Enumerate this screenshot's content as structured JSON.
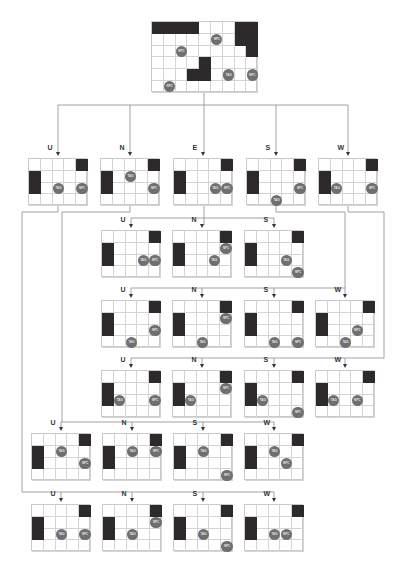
{
  "colors": {
    "line": "#8a8a8a",
    "wall": "#2e2a2b",
    "agent": "#6f6f6f",
    "grid": "#d4d4d4"
  },
  "legend": {
    "tag_label": "TAG",
    "npc_label": "NPC"
  },
  "root": {
    "x": 151,
    "y": 21,
    "cols": 9,
    "rows": 6,
    "cell": 11.8,
    "walls": [
      [
        0,
        0,
        4,
        1
      ],
      [
        7,
        0,
        2,
        2
      ],
      [
        8,
        2,
        1,
        1
      ],
      [
        4,
        3,
        1,
        2
      ],
      [
        3,
        4,
        1,
        1
      ]
    ],
    "agents": [
      {
        "t": "NPC",
        "c": 5.5,
        "r": 1.5
      },
      {
        "t": "NPC",
        "c": 2.5,
        "r": 2.5
      },
      {
        "t": "TAG",
        "c": 6.5,
        "r": 4.5
      },
      {
        "t": "NPC",
        "c": 8.5,
        "r": 4.5
      },
      {
        "t": "NPC",
        "c": 1.5,
        "r": 5.5
      }
    ]
  },
  "nodes": [
    {
      "id": "r1-U",
      "label": "U",
      "x": 28,
      "y": 158,
      "tag": [
        2.5,
        2.5
      ],
      "npc": [
        4.5,
        2.5
      ]
    },
    {
      "id": "r1-N",
      "label": "N",
      "x": 100,
      "y": 158,
      "tag": [
        2.5,
        1.5
      ],
      "npc": [
        4.5,
        2.5
      ]
    },
    {
      "id": "r1-E",
      "label": "E",
      "x": 173,
      "y": 158,
      "tag": [
        3.5,
        2.5
      ],
      "npc": [
        4.5,
        2.5
      ]
    },
    {
      "id": "r1-S",
      "label": "S",
      "x": 246,
      "y": 158,
      "tag": [
        2.5,
        3.5
      ],
      "npc": [
        4.5,
        2.5
      ]
    },
    {
      "id": "r1-W",
      "label": "W",
      "x": 318,
      "y": 158,
      "tag": [
        1.5,
        2.5
      ],
      "npc": [
        4.5,
        2.5
      ]
    },
    {
      "id": "r2-U",
      "label": "U",
      "x": 101,
      "y": 230,
      "tag": [
        3.5,
        2.5
      ],
      "npc": [
        4.5,
        2.5
      ]
    },
    {
      "id": "r2-N",
      "label": "N",
      "x": 172,
      "y": 230,
      "tag": [
        3.5,
        2.5
      ],
      "npc": [
        4.5,
        1.5
      ]
    },
    {
      "id": "r2-S",
      "label": "S",
      "x": 244,
      "y": 230,
      "tag": [
        3.5,
        2.5
      ],
      "npc": [
        4.5,
        3.5
      ]
    },
    {
      "id": "r3-U",
      "label": "U",
      "x": 101,
      "y": 300,
      "tag": [
        2.5,
        3.5
      ],
      "npc": [
        4.5,
        2.5
      ]
    },
    {
      "id": "r3-N",
      "label": "N",
      "x": 172,
      "y": 300,
      "tag": [
        2.5,
        3.5
      ],
      "npc": [
        4.5,
        1.5
      ]
    },
    {
      "id": "r3-S",
      "label": "S",
      "x": 244,
      "y": 300,
      "tag": [
        2.5,
        3.5
      ],
      "npc": [
        4.5,
        3.5
      ]
    },
    {
      "id": "r3-W",
      "label": "W",
      "x": 315,
      "y": 300,
      "tag": [
        2.5,
        3.5
      ],
      "npc": [
        3.5,
        2.5
      ]
    },
    {
      "id": "r4-U",
      "label": "U",
      "x": 101,
      "y": 370,
      "tag": [
        1.5,
        2.5
      ],
      "npc": [
        4.5,
        2.5
      ]
    },
    {
      "id": "r4-N",
      "label": "N",
      "x": 172,
      "y": 370,
      "tag": [
        1.5,
        2.5
      ],
      "npc": [
        4.5,
        1.5
      ]
    },
    {
      "id": "r4-S",
      "label": "S",
      "x": 244,
      "y": 370,
      "tag": [
        1.5,
        2.5
      ],
      "npc": [
        4.5,
        3.5
      ]
    },
    {
      "id": "r4-W",
      "label": "W",
      "x": 315,
      "y": 370,
      "tag": [
        1.5,
        2.5
      ],
      "npc": [
        3.5,
        2.5
      ]
    },
    {
      "id": "r5-U",
      "label": "U",
      "x": 31,
      "y": 433,
      "tag": [
        2.5,
        1.5
      ],
      "npc": [
        4.5,
        2.5
      ]
    },
    {
      "id": "r5-N",
      "label": "N",
      "x": 102,
      "y": 433,
      "tag": [
        2.5,
        1.5
      ],
      "npc": [
        4.5,
        1.5
      ]
    },
    {
      "id": "r5-S",
      "label": "S",
      "x": 173,
      "y": 433,
      "tag": [
        2.5,
        1.5
      ],
      "npc": [
        4.5,
        3.5
      ]
    },
    {
      "id": "r5-W",
      "label": "W",
      "x": 244,
      "y": 433,
      "tag": [
        2.5,
        1.5
      ],
      "npc": [
        3.5,
        2.5
      ]
    },
    {
      "id": "r6-U",
      "label": "U",
      "x": 31,
      "y": 504,
      "tag": [
        2.5,
        2.5
      ],
      "npc": [
        4.5,
        2.5
      ]
    },
    {
      "id": "r6-N",
      "label": "N",
      "x": 102,
      "y": 504,
      "tag": [
        2.5,
        2.5
      ],
      "npc": [
        4.5,
        1.5
      ]
    },
    {
      "id": "r6-S",
      "label": "S",
      "x": 173,
      "y": 504,
      "tag": [
        2.5,
        2.5
      ],
      "npc": [
        4.5,
        3.5
      ]
    },
    {
      "id": "r6-W",
      "label": "W",
      "x": 244,
      "y": 504,
      "tag": [
        2.5,
        2.5
      ],
      "npc": [
        3.5,
        2.5
      ]
    }
  ],
  "small_grid": {
    "cols": 5,
    "rows": 4,
    "cell": 11.8,
    "walls": [
      [
        0,
        1,
        1,
        2
      ],
      [
        4,
        0,
        1,
        1
      ]
    ]
  },
  "edges": [
    "M204 92 V105",
    "M58 105 H348",
    "M58 105 V152",
    "M130 105 V152",
    "M204 105 V152",
    "M276 105 V152",
    "M348 105 V152",
    "M204 205 V218",
    "M131 218 H274",
    "M131 218 V225",
    "M274 218 V225",
    "M204 218 V225",
    "M276 205 V212 H345 V288",
    "M131 288 H345",
    "M131 288 V295",
    "M202 288 V295",
    "M274 288 V295",
    "M345 288 V295",
    "M348 205 V212 H384 V358",
    "M131 358 H384",
    "M131 358 V365",
    "M202 358 V365",
    "M274 358 V365",
    "M345 358 V365",
    "M130 205 V212 H62 V422",
    "M61 422 H274",
    "M61 422 V428",
    "M132 422 V428",
    "M203 422 V428",
    "M274 422 V428",
    "M58 205 V212 H22 V492 H274",
    "M61 492 V499",
    "M132 492 V499",
    "M203 492 V499",
    "M274 492 V499"
  ]
}
